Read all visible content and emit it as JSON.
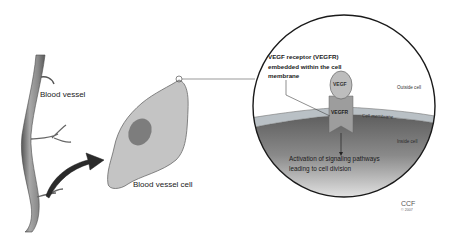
{
  "diagram": {
    "labels": {
      "blood_vessel": "Blood vessel",
      "blood_vessel_cell": "Blood vessel cell",
      "receptor_callout": "VEGF receptor (VEGFR) embedded within the cell membrane",
      "outside_cell": "Outside cell",
      "cell_membrane": "Cell membrane",
      "inside_cell": "Inside cell",
      "activation": "Activation of signaling pathways leading to cell division",
      "vegf": "VEGF",
      "vegfr": "VEGFR"
    },
    "credit": {
      "org": "CCF",
      "copyright": "© 2007"
    },
    "colors": {
      "vessel": "#8a8a8a",
      "cell_fill": "#c4c4c4",
      "nucleus": "#7d7d7d",
      "arrow": "#2a2a2a",
      "membrane": "#b9c0c5",
      "inside_dark": "#5e5e5e",
      "inside_light": "#f2f2f2",
      "vegf_fill": "#bdbdbd",
      "vegfr_fill": "#9d9d9d",
      "outline": "#1a1a1a"
    }
  }
}
